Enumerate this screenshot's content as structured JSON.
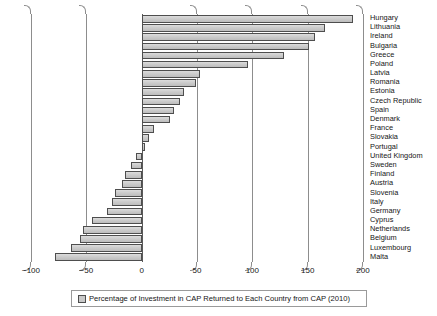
{
  "chart_data": {
    "type": "bar",
    "orientation": "horizontal",
    "title": "",
    "xlabel": "",
    "ylabel": "",
    "xlim": [
      -100,
      200
    ],
    "xticks": [
      "-100",
      "-50",
      "0",
      "50",
      "100",
      "150",
      "200"
    ],
    "xtick_values": [
      -100,
      -50,
      0,
      50,
      100,
      150,
      200
    ],
    "grid": true,
    "legend_position": "bottom",
    "legend": [
      "Percentage of Investment in CAP Returned to Each Country from CAP (2010)"
    ],
    "series_name": "Percentage of Investment in CAP Returned to Each Country from CAP (2010)",
    "bar_color": "#c9c9c9",
    "bar_edge_color": "#4e4e4e",
    "categories": [
      "Hungary",
      "Lithuania",
      "Ireland",
      "Bulgaria",
      "Greece",
      "Poland",
      "Latvia",
      "Romania",
      "Estonia",
      "Czech Republic",
      "Spain",
      "Denmark",
      "France",
      "Slovakia",
      "Portugal",
      "United Kingdom",
      "Sweden",
      "Finland",
      "Austria",
      "Slovenia",
      "Italy",
      "Germany",
      "Cyprus",
      "Netherlands",
      "Belgium",
      "Luxembourg",
      "Malta"
    ],
    "values": [
      191,
      166,
      157,
      151,
      129,
      96,
      53,
      49,
      38,
      35,
      29,
      26,
      11,
      7,
      3,
      -5,
      -10,
      -15,
      -18,
      -24,
      -27,
      -31,
      -45,
      -53,
      -56,
      -64,
      -78
    ]
  },
  "axis": {
    "ticks": [
      {
        "label": "-100",
        "value": -100
      },
      {
        "label": "-50",
        "value": -50
      },
      {
        "label": "0",
        "value": 0
      },
      {
        "label": "50",
        "value": 50
      },
      {
        "label": "100",
        "value": 100
      },
      {
        "label": "150",
        "value": 150
      },
      {
        "label": "200",
        "value": 200
      }
    ]
  },
  "legend": {
    "label": "Percentage of Investment in CAP Returned to Each Country from CAP (2010)",
    "swatch_color": "#c9c9c9"
  }
}
